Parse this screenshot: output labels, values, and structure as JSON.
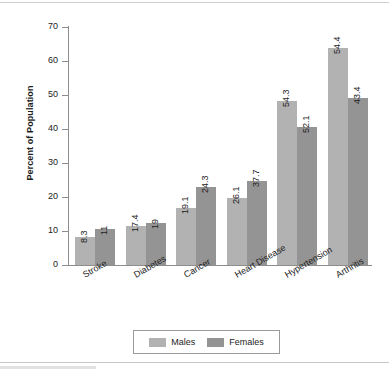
{
  "chart_data": {
    "type": "bar",
    "title": "",
    "xlabel": "",
    "ylabel": "Percent of Population",
    "ylim": [
      0,
      70
    ],
    "yticks": [
      0,
      10,
      20,
      30,
      40,
      50,
      60,
      70
    ],
    "ytick_labels": [
      "0",
      "10",
      "20",
      "30",
      "40",
      "50",
      "60",
      "70"
    ],
    "grid": false,
    "legend_position": "bottom",
    "categories": [
      "Stroke",
      "Diabetes",
      "Cancer",
      "Heart Disease",
      "Hypertension",
      "Arthritis"
    ],
    "series": [
      {
        "name": "Males",
        "color": "#b2b2b2",
        "values": [
          8.3,
          17.4,
          19.1,
          26.1,
          54.3,
          54.4
        ],
        "value_labels": [
          "8.3",
          "17.4",
          "19.1",
          "26.1",
          "54.3",
          "54.4"
        ],
        "plotted_heights": [
          8.3,
          11.6,
          16.9,
          19.6,
          48.2,
          63.8
        ]
      },
      {
        "name": "Females",
        "color": "#949494",
        "values": [
          11,
          19,
          24.3,
          37.7,
          52.1,
          43.4
        ],
        "value_labels": [
          "11",
          "19",
          "24.3",
          "37.7",
          "52.1",
          "43.4"
        ],
        "plotted_heights": [
          10.7,
          12.5,
          23.0,
          24.6,
          40.5,
          49.2
        ]
      }
    ]
  },
  "legend": {
    "items": [
      {
        "label": "Males",
        "color": "#b2b2b2"
      },
      {
        "label": "Females",
        "color": "#949494"
      }
    ]
  },
  "axis": {
    "y_title": "Percent of Population"
  }
}
